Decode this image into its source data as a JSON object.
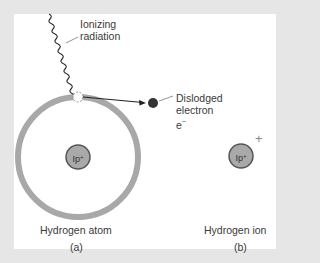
{
  "diagram": {
    "type": "physics-illustration",
    "panels": [
      {
        "id": "a",
        "caption": "Hydrogen atom",
        "label": "(a)",
        "nucleus": {
          "text": "Ip",
          "superscript": "+"
        },
        "has_orbit": true
      },
      {
        "id": "b",
        "caption": "Hydrogen ion",
        "label": "(b)",
        "nucleus": {
          "text": "Ip",
          "superscript": "+"
        },
        "charge_mark": "+"
      }
    ],
    "annotations": {
      "radiation": {
        "line1": "Ionizing",
        "line2": "radiation"
      },
      "electron": {
        "line1": "Dislodged",
        "line2": "electron",
        "line3_base": "e",
        "line3_sup": "−"
      }
    },
    "colors": {
      "background": "#e6e6e6",
      "panel": "#ffffff",
      "orbit": "#a8a8a8",
      "nucleus_fill": "#a9a9a9",
      "nucleus_stroke": "#555555",
      "electron": "#333333",
      "text": "#3a3a3a"
    }
  }
}
